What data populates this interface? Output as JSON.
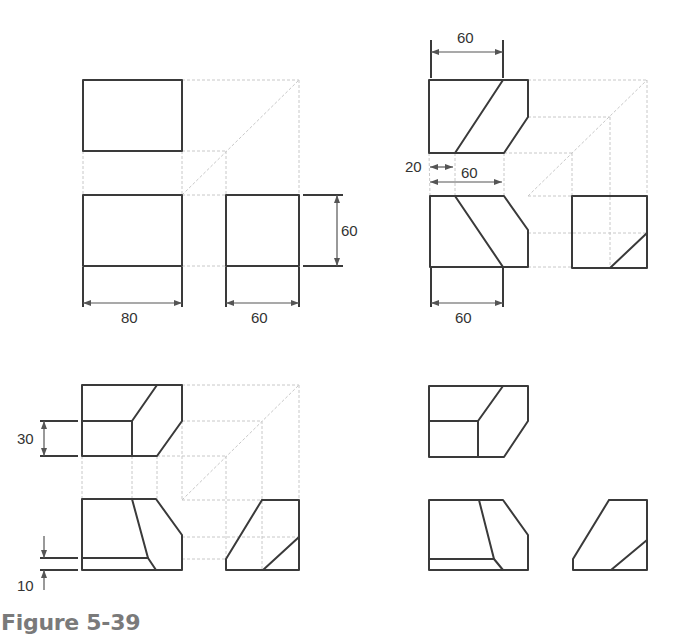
{
  "caption": "Figure 5-39",
  "colors": {
    "object_line": "#3a3a3a",
    "projection_line": "#c8c8c8",
    "caption": "#7a7a7a"
  },
  "panels": [
    {
      "id": "a",
      "position": "top-left",
      "views": {
        "top": {
          "polylines": [
            [
              [
                83,
                80
              ],
              [
                182,
                80
              ],
              [
                182,
                151
              ],
              [
                83,
                151
              ],
              [
                83,
                80
              ]
            ]
          ]
        },
        "front": {
          "polylines": [
            [
              [
                83,
                195
              ],
              [
                182,
                195
              ],
              [
                182,
                266
              ],
              [
                83,
                266
              ],
              [
                83,
                195
              ]
            ]
          ]
        },
        "side": {
          "polylines": [
            [
              [
                226,
                195
              ],
              [
                299,
                195
              ],
              [
                299,
                266
              ],
              [
                226,
                266
              ],
              [
                226,
                195
              ]
            ]
          ]
        }
      },
      "projection_lines": [
        [
          [
            182,
            80
          ],
          [
            299,
            80
          ]
        ],
        [
          [
            182,
            151
          ],
          [
            226,
            151
          ]
        ],
        [
          [
            226,
            151
          ],
          [
            226,
            195
          ]
        ],
        [
          [
            299,
            80
          ],
          [
            299,
            195
          ]
        ],
        [
          [
            182,
            195
          ],
          [
            226,
            195
          ]
        ],
        [
          [
            182,
            266
          ],
          [
            226,
            266
          ]
        ],
        [
          [
            83,
            151
          ],
          [
            83,
            195
          ]
        ],
        [
          [
            182,
            151
          ],
          [
            182,
            195
          ]
        ],
        [
          [
            182,
            195
          ],
          [
            299,
            80
          ]
        ]
      ],
      "dimensions": [
        {
          "label": "80",
          "type": "h",
          "x1": 83,
          "x2": 182,
          "y": 303,
          "ext_from": 267,
          "text_x": 121,
          "text_y": 323
        },
        {
          "label": "60",
          "type": "h",
          "x1": 226,
          "x2": 299,
          "y": 303,
          "ext_from": 267,
          "text_x": 251,
          "text_y": 323
        },
        {
          "label": "60",
          "type": "v",
          "y1": 195,
          "y2": 266,
          "x": 337,
          "ext_from": 303,
          "text_x": 341,
          "text_y": 236
        }
      ]
    },
    {
      "id": "b",
      "position": "top-right",
      "views": {
        "top": {
          "polylines": [
            [
              [
                429,
                80
              ],
              [
                528,
                80
              ],
              [
                528,
                117
              ],
              [
                504,
                153
              ],
              [
                429,
                153
              ],
              [
                429,
                80
              ]
            ],
            [
              [
                503,
                80
              ],
              [
                455,
                153
              ]
            ]
          ]
        },
        "front": {
          "polylines": [
            [
              [
                430,
                196
              ],
              [
                504,
                196
              ],
              [
                528,
                230
              ],
              [
                528,
                267
              ],
              [
                430,
                267
              ],
              [
                430,
                196
              ]
            ],
            [
              [
                455,
                196
              ],
              [
                503,
                267
              ]
            ]
          ]
        },
        "side": {
          "polylines": [
            [
              [
                572,
                196
              ],
              [
                647,
                196
              ],
              [
                647,
                268
              ],
              [
                572,
                268
              ],
              [
                572,
                196
              ]
            ],
            [
              [
                610,
                268
              ],
              [
                647,
                233
              ]
            ]
          ]
        }
      },
      "projection_lines": [
        [
          [
            528,
            80
          ],
          [
            647,
            80
          ]
        ],
        [
          [
            528,
            117
          ],
          [
            610,
            117
          ]
        ],
        [
          [
            504,
            153
          ],
          [
            572,
            153
          ]
        ],
        [
          [
            647,
            80
          ],
          [
            647,
            196
          ]
        ],
        [
          [
            610,
            117
          ],
          [
            610,
            268
          ]
        ],
        [
          [
            572,
            153
          ],
          [
            572,
            196
          ]
        ],
        [
          [
            528,
            196
          ],
          [
            572,
            196
          ]
        ],
        [
          [
            528,
            233
          ],
          [
            647,
            233
          ]
        ],
        [
          [
            528,
            267
          ],
          [
            572,
            267
          ]
        ],
        [
          [
            455,
            153
          ],
          [
            455,
            196
          ]
        ],
        [
          [
            504,
            153
          ],
          [
            504,
            196
          ]
        ],
        [
          [
            429,
            153
          ],
          [
            430,
            196
          ]
        ],
        [
          [
            528,
            196
          ],
          [
            647,
            80
          ]
        ]
      ],
      "dimensions": [
        {
          "label": "60",
          "type": "h",
          "x1": 431,
          "x2": 503,
          "y": 52,
          "ext_from": 78,
          "ext_to": 40,
          "text_x": 457,
          "text_y": 43
        },
        {
          "label": "20",
          "type": "h-small",
          "x1": 430,
          "x2": 453,
          "y": 167,
          "text_x": 405,
          "text_y": 172
        },
        {
          "label": "60",
          "type": "h",
          "x1": 430,
          "x2": 502,
          "y": 182,
          "text_x": 461,
          "text_y": 178,
          "no_ext": true
        },
        {
          "label": "60",
          "type": "h",
          "x1": 431,
          "x2": 503,
          "y": 303,
          "ext_from": 268,
          "text_x": 455,
          "text_y": 323
        }
      ]
    },
    {
      "id": "c",
      "position": "bottom-left",
      "views": {
        "top": {
          "polylines": [
            [
              [
                82,
                385
              ],
              [
                182,
                385
              ],
              [
                182,
                421
              ],
              [
                157,
                456
              ],
              [
                82,
                456
              ],
              [
                82,
                385
              ]
            ],
            [
              [
                82,
                421
              ],
              [
                132,
                421
              ]
            ],
            [
              [
                132,
                421
              ],
              [
                132,
                456
              ]
            ],
            [
              [
                132,
                421
              ],
              [
                157,
                385
              ]
            ]
          ]
        },
        "front": {
          "polylines": [
            [
              [
                82,
                499
              ],
              [
                156,
                499
              ],
              [
                182,
                535
              ],
              [
                182,
                570
              ],
              [
                82,
                570
              ],
              [
                82,
                499
              ]
            ],
            [
              [
                132,
                499
              ],
              [
                148,
                558
              ],
              [
                156,
                570
              ]
            ],
            [
              [
                82,
                558
              ],
              [
                148,
                558
              ]
            ]
          ]
        },
        "side": {
          "polylines": [
            [
              [
                262,
                500
              ],
              [
                299,
                500
              ],
              [
                299,
                570
              ],
              [
                226,
                570
              ],
              [
                226,
                559
              ],
              [
                262,
                500
              ]
            ],
            [
              [
                263,
                570
              ],
              [
                299,
                537
              ]
            ]
          ]
        }
      },
      "projection_lines": [
        [
          [
            182,
            385
          ],
          [
            299,
            385
          ]
        ],
        [
          [
            182,
            421
          ],
          [
            262,
            421
          ]
        ],
        [
          [
            157,
            456
          ],
          [
            226,
            456
          ]
        ],
        [
          [
            299,
            385
          ],
          [
            299,
            500
          ]
        ],
        [
          [
            262,
            421
          ],
          [
            262,
            570
          ]
        ],
        [
          [
            226,
            456
          ],
          [
            226,
            559
          ]
        ],
        [
          [
            182,
            500
          ],
          [
            262,
            500
          ]
        ],
        [
          [
            182,
            537
          ],
          [
            299,
            537
          ]
        ],
        [
          [
            182,
            559
          ],
          [
            226,
            559
          ]
        ],
        [
          [
            132,
            456
          ],
          [
            132,
            499
          ]
        ],
        [
          [
            157,
            456
          ],
          [
            157,
            499
          ]
        ],
        [
          [
            82,
            456
          ],
          [
            82,
            499
          ]
        ],
        [
          [
            182,
            421
          ],
          [
            182,
            499
          ]
        ],
        [
          [
            182,
            500
          ],
          [
            299,
            385
          ]
        ]
      ],
      "dimensions": [
        {
          "label": "30",
          "type": "v",
          "y1": 421,
          "y2": 456,
          "x": 44,
          "ext_x1": 40,
          "ext_x2": 78,
          "text_x": 17,
          "text_y": 444
        },
        {
          "label": "10",
          "type": "v-small",
          "y1": 558,
          "y2": 570,
          "x": 44,
          "ext_x1": 40,
          "ext_x2": 78,
          "text_x": 17,
          "text_y": 591
        }
      ]
    },
    {
      "id": "d",
      "position": "bottom-right",
      "views": {
        "top": {
          "polylines": [
            [
              [
                429,
                386
              ],
              [
                528,
                386
              ],
              [
                528,
                421
              ],
              [
                504,
                457
              ],
              [
                429,
                457
              ],
              [
                429,
                386
              ]
            ],
            [
              [
                429,
                421
              ],
              [
                478,
                421
              ]
            ],
            [
              [
                478,
                421
              ],
              [
                478,
                457
              ]
            ],
            [
              [
                478,
                421
              ],
              [
                503,
                386
              ]
            ]
          ]
        },
        "front": {
          "polylines": [
            [
              [
                429,
                500
              ],
              [
                503,
                500
              ],
              [
                528,
                535
              ],
              [
                528,
                570
              ],
              [
                429,
                570
              ],
              [
                429,
                500
              ]
            ],
            [
              [
                479,
                500
              ],
              [
                494,
                559
              ],
              [
                503,
                570
              ]
            ],
            [
              [
                429,
                559
              ],
              [
                494,
                559
              ]
            ]
          ]
        },
        "side": {
          "polylines": [
            [
              [
                609,
                500
              ],
              [
                647,
                500
              ],
              [
                647,
                570
              ],
              [
                573,
                570
              ],
              [
                573,
                559
              ],
              [
                609,
                500
              ]
            ],
            [
              [
                611,
                570
              ],
              [
                647,
                540
              ]
            ]
          ]
        }
      },
      "projection_lines": [],
      "dimensions": []
    }
  ]
}
